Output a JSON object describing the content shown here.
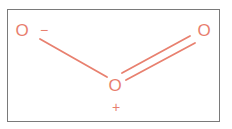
{
  "molecule": {
    "name": "ozone",
    "atoms": [
      {
        "id": "o1",
        "symbol": "O",
        "charge": "−",
        "x": 22,
        "y": 30
      },
      {
        "id": "o2",
        "symbol": "O",
        "charge": "+",
        "x": 115,
        "y": 85
      },
      {
        "id": "o3",
        "symbol": "O",
        "charge": "",
        "x": 204,
        "y": 30
      }
    ],
    "bonds": [
      {
        "from": "o1",
        "to": "o2",
        "order": 1
      },
      {
        "from": "o2",
        "to": "o3",
        "order": 2
      }
    ]
  },
  "labels": {
    "left_atom": "O",
    "left_charge": "−",
    "center_atom": "O",
    "center_charge": "+",
    "right_atom": "O"
  },
  "colors": {
    "atom": "#e8806f",
    "bond": "#e8806f",
    "border": "#7a7a7a"
  }
}
